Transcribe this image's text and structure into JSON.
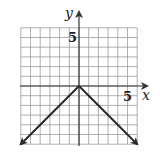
{
  "chart_data": {
    "type": "line",
    "title": "",
    "xlabel": "x",
    "ylabel": "y",
    "xlim": [
      -6,
      6
    ],
    "ylim": [
      -6,
      6
    ],
    "grid": true,
    "tick_labels": {
      "x": [
        "5"
      ],
      "y": [
        "5"
      ]
    },
    "series": [
      {
        "name": "y = -|x|",
        "x": [
          -6,
          0,
          6
        ],
        "y": [
          -6,
          0,
          -6
        ],
        "arrows": "both-ends"
      }
    ]
  },
  "labels": {
    "x_axis": "x",
    "y_axis": "y",
    "x_tick": "5",
    "y_tick": "5"
  },
  "colors": {
    "grid": "#9a9a9a",
    "axis": "#333333",
    "curve": "#2a2a2a"
  }
}
